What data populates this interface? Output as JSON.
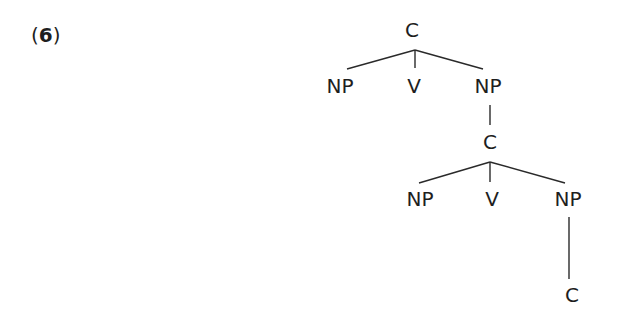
{
  "example": {
    "open": "(",
    "number": "6",
    "close": ")"
  },
  "tree": {
    "nodes": [
      {
        "id": "c1",
        "label": "C",
        "x": 412,
        "y": 30
      },
      {
        "id": "np1",
        "label": "NP",
        "x": 340,
        "y": 86
      },
      {
        "id": "v1",
        "label": "V",
        "x": 414,
        "y": 86
      },
      {
        "id": "np2",
        "label": "NP",
        "x": 488,
        "y": 86
      },
      {
        "id": "c2",
        "label": "C",
        "x": 490,
        "y": 142
      },
      {
        "id": "np3",
        "label": "NP",
        "x": 420,
        "y": 199
      },
      {
        "id": "v2",
        "label": "V",
        "x": 492,
        "y": 199
      },
      {
        "id": "np4",
        "label": "NP",
        "x": 568,
        "y": 199
      },
      {
        "id": "c3",
        "label": "C",
        "x": 572,
        "y": 295
      }
    ],
    "edges": [
      {
        "from": "c1",
        "to": "np1"
      },
      {
        "from": "c1",
        "to": "v1"
      },
      {
        "from": "c1",
        "to": "np2"
      },
      {
        "from": "np2",
        "to": "c2"
      },
      {
        "from": "c2",
        "to": "np3"
      },
      {
        "from": "c2",
        "to": "v2"
      },
      {
        "from": "c2",
        "to": "np4"
      },
      {
        "from": "np4",
        "to": "c3"
      }
    ]
  }
}
